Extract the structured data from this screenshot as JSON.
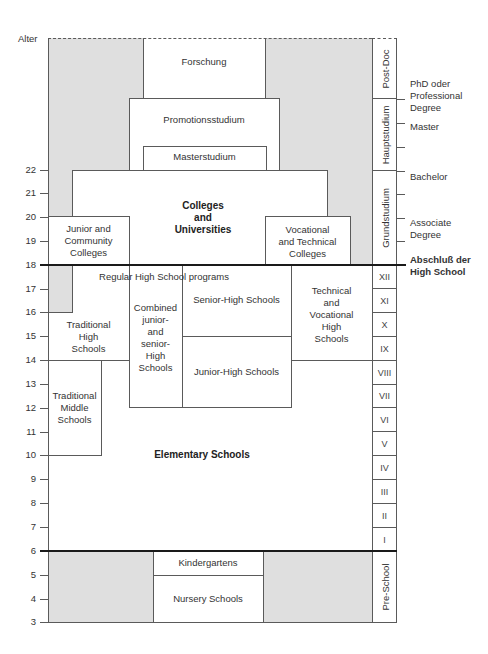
{
  "axis": {
    "title": "Alter",
    "ticks": [
      "22",
      "21",
      "20",
      "19",
      "18",
      "17",
      "16",
      "15",
      "14",
      "13",
      "12",
      "11",
      "10",
      "9",
      "8",
      "7",
      "6",
      "5",
      "4",
      "3"
    ]
  },
  "higher_ed": {
    "research": "Forschung",
    "doctoral": "Promotionsstudium",
    "masters": "Masterstudium",
    "colleges_universities": "Colleges\nand\nUniversities",
    "junior_community": "Junior and\nCommunity\nColleges",
    "vocational_technical_colleges": "Vocational\nand Technical\nColleges"
  },
  "secondary": {
    "regular_programs": "Regular High School programs",
    "senior_high": "Senior-High Schools",
    "junior_high": "Junior-High Schools",
    "combined": "Combined\njunior-\nand\nsenior-\nHigh\nSchools",
    "technical_vocational_high": "Technical\nand\nVocational\nHigh\nSchools",
    "traditional_high": "Traditional\nHigh\nSchools",
    "traditional_middle": "Traditional\nMiddle\nSchools"
  },
  "primary": {
    "elementary": "Elementary Schools"
  },
  "preschool": {
    "kindergartens": "Kindergartens",
    "nursery": "Nursery Schools"
  },
  "stage_column": {
    "post_doc": "Post-Doc",
    "hauptstudium": "Hauptstudium",
    "grundstudium": "Grundstudium",
    "grades": [
      "XII",
      "XI",
      "X",
      "IX",
      "VIII",
      "VII",
      "VI",
      "V",
      "IV",
      "III",
      "II",
      "I"
    ],
    "pre_school": "Pre-School"
  },
  "degrees": {
    "phd": "PhD oder\nProfessional\nDegree",
    "master": "Master",
    "bachelor": "Bachelor",
    "associate": "Associate\nDegree",
    "high_school_diploma": "Abschluß der\nHigh School"
  },
  "colors": {
    "gray_fill": "#dfdfdf",
    "line": "#5a5a5a",
    "thick_line": "#1a1a1a"
  }
}
